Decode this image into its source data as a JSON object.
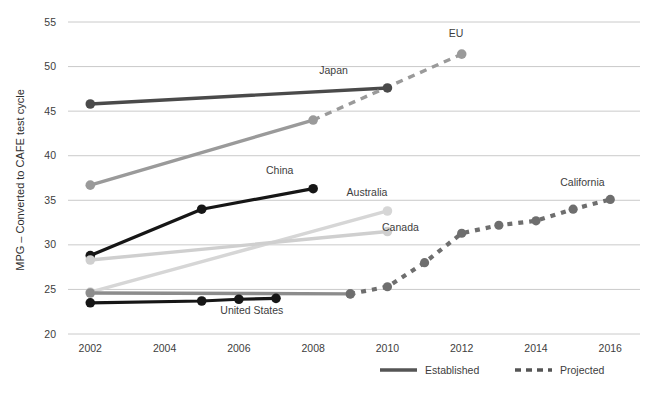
{
  "chart_data": {
    "type": "line",
    "title": "",
    "xlabel": "",
    "ylabel": "MPG – Converted to CAFE test cycle",
    "xlim": [
      2001.4,
      2016.8
    ],
    "ylim": [
      20,
      55
    ],
    "yticks": [
      20,
      25,
      30,
      35,
      40,
      45,
      50,
      55
    ],
    "xticks": [
      2002,
      2004,
      2006,
      2008,
      2010,
      2012,
      2014,
      2016
    ],
    "grid": true,
    "legend_position": "bottom",
    "legend": [
      {
        "label": "Established",
        "style": "solid"
      },
      {
        "label": "Projected",
        "style": "dashed"
      }
    ],
    "series": [
      {
        "name": "Japan",
        "label": "Japan",
        "color": "#4a4a4a",
        "width": 3.4,
        "style": "solid",
        "label_x": 2008.55,
        "label_y": 49.2,
        "points": [
          {
            "x": 2002,
            "y": 45.8,
            "marker": true
          },
          {
            "x": 2010,
            "y": 47.6,
            "marker": true
          }
        ]
      },
      {
        "name": "EU",
        "label": "EU",
        "color": "#9a9a9a",
        "width": 3.4,
        "style": "solid",
        "label_x": 2011.85,
        "label_y": 53.3,
        "points": [
          {
            "x": 2002,
            "y": 36.7,
            "marker": true
          },
          {
            "x": 2008,
            "y": 44.0,
            "marker": true
          }
        ]
      },
      {
        "name": "EU projected",
        "label": "",
        "color": "#9a9a9a",
        "width": 3.4,
        "style": "dashed",
        "points": [
          {
            "x": 2008,
            "y": 44.0,
            "marker": false
          },
          {
            "x": 2012,
            "y": 51.4,
            "marker": true
          }
        ]
      },
      {
        "name": "China",
        "label": "China",
        "color": "#161616",
        "width": 3.2,
        "style": "solid",
        "label_x": 2007.1,
        "label_y": 38.0,
        "points": [
          {
            "x": 2002,
            "y": 28.8,
            "marker": true
          },
          {
            "x": 2005,
            "y": 34.0,
            "marker": true
          },
          {
            "x": 2008,
            "y": 36.3,
            "marker": true
          }
        ]
      },
      {
        "name": "Australia",
        "label": "Australia",
        "color": "#d6d6d6",
        "width": 3.4,
        "style": "solid",
        "label_x": 2009.45,
        "label_y": 35.5,
        "points": [
          {
            "x": 2002,
            "y": 24.7,
            "marker": true
          },
          {
            "x": 2010,
            "y": 33.8,
            "marker": true
          }
        ]
      },
      {
        "name": "Canada",
        "label": "Canada",
        "color": "#cfcfcf",
        "width": 3.4,
        "style": "solid",
        "label_x": 2010.35,
        "label_y": 31.6,
        "points": [
          {
            "x": 2002,
            "y": 28.3,
            "marker": true
          },
          {
            "x": 2010,
            "y": 31.5,
            "marker": true
          }
        ]
      },
      {
        "name": "United States established gray",
        "label": "",
        "color": "#8c8c8c",
        "width": 3.4,
        "style": "solid",
        "points": [
          {
            "x": 2002,
            "y": 24.6,
            "marker": true
          },
          {
            "x": 2009,
            "y": 24.5,
            "marker": true
          }
        ]
      },
      {
        "name": "United States",
        "label": "United States",
        "color": "#161616",
        "width": 3.2,
        "style": "solid",
        "label_x": 2006.35,
        "label_y": 22.2,
        "points": [
          {
            "x": 2002,
            "y": 23.5,
            "marker": true
          },
          {
            "x": 2005,
            "y": 23.7,
            "marker": true
          },
          {
            "x": 2006,
            "y": 23.9,
            "marker": true
          },
          {
            "x": 2007,
            "y": 24.0,
            "marker": true
          }
        ]
      },
      {
        "name": "California",
        "label": "California",
        "color": "#6e6e6e",
        "width": 4.2,
        "style": "dotted",
        "label_x": 2015.25,
        "label_y": 36.6,
        "points": [
          {
            "x": 2009,
            "y": 24.5,
            "marker": true
          },
          {
            "x": 2010,
            "y": 25.3,
            "marker": true
          },
          {
            "x": 2011,
            "y": 28.0,
            "marker": true
          },
          {
            "x": 2012,
            "y": 31.3,
            "marker": true
          },
          {
            "x": 2013,
            "y": 32.2,
            "marker": true
          },
          {
            "x": 2014,
            "y": 32.7,
            "marker": true
          },
          {
            "x": 2015,
            "y": 34.0,
            "marker": true
          },
          {
            "x": 2016,
            "y": 35.1,
            "marker": true
          }
        ]
      }
    ]
  },
  "colors": {
    "gridline": "#bdbdbd",
    "text": "#3d3d3d",
    "legend_line": "#555555",
    "background": "#ffffff"
  }
}
